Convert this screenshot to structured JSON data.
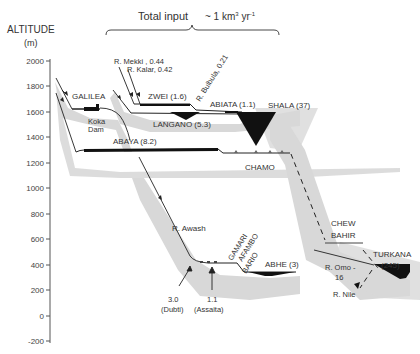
{
  "header": {
    "clipped_caption": "Ethiopian rift",
    "total_input_label": "Total input",
    "total_input_value": "~ 1 km³ yr⁻¹"
  },
  "axis": {
    "title": "ALTITUDE",
    "unit": "(m)",
    "ticks": [
      "2000",
      "1800",
      "1600",
      "1400",
      "1200",
      "1000",
      "800",
      "600",
      "400",
      "200",
      "0",
      "-200"
    ]
  },
  "lakes": {
    "galilea": "GALILEA",
    "koka": "Koka",
    "koka_dam": "Dam",
    "zwei": "ZWEI (1.6)",
    "langano": "LANGANO (5.3)",
    "abiata": "ABIATA (1.1)",
    "shala": "SHALA (37)",
    "abaya": "ABAYA (8.2)",
    "chamo": "CHAMO",
    "chew": "CHEW",
    "bahir": "BAHIR",
    "turkana": "TURKANA",
    "turkana_vol": "(245)",
    "gamari": "GAMARI",
    "afambo": "AFAMBO",
    "bario": "BARIO",
    "abhe": "ABHE (3)"
  },
  "rivers": {
    "mekki": "R. Mekki , 0.44",
    "kalar": "R. Kalar, 0.42",
    "bulbula": "R. Bulbula, 0.21",
    "awash": "R. Awash",
    "omo": "R. Omo -",
    "omo_flow": "16",
    "nile": "R. Nile"
  },
  "springs": {
    "dubti_value": "3.0",
    "dubti_name": "(Dubti)",
    "assaita_value": "1.1",
    "assaita_name": "(Assaita)"
  }
}
